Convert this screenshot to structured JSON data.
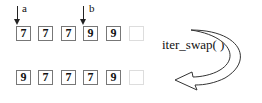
{
  "pointers": [
    {
      "label": "a",
      "index": 0
    },
    {
      "label": "b",
      "index": 3
    }
  ],
  "before": {
    "values": [
      "7",
      "7",
      "7",
      "9",
      "9",
      ""
    ]
  },
  "after": {
    "values": [
      "9",
      "7",
      "7",
      "7",
      "9",
      ""
    ]
  },
  "operation": {
    "label": "iter_swap( )"
  }
}
